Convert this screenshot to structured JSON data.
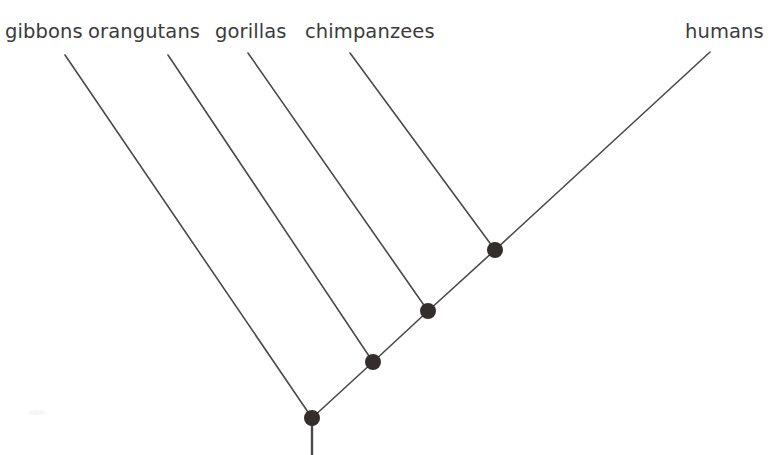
{
  "figure": {
    "title_partial": "",
    "background_color": "#ffffff",
    "branch_color": "#4a4a4a",
    "node_color": "#332d2b",
    "label_color": "#3b3b3b"
  },
  "chart_data": {
    "type": "diagram",
    "diagram_type": "cladogram",
    "title": "",
    "xlabel": "",
    "ylabel": "",
    "taxa": [
      {
        "name": "gibbons",
        "label_x": 5,
        "label_y": 40,
        "tip_x": 65,
        "tip_y": 55,
        "parent": "root"
      },
      {
        "name": "orangutans",
        "label_x": 88,
        "label_y": 40,
        "tip_x": 168,
        "tip_y": 55,
        "parent": "node2"
      },
      {
        "name": "gorillas",
        "label_x": 215,
        "label_y": 40,
        "tip_x": 248,
        "tip_y": 53,
        "parent": "node3"
      },
      {
        "name": "chimpanzees",
        "label_x": 305,
        "label_y": 40,
        "tip_x": 350,
        "tip_y": 53,
        "parent": "node4"
      },
      {
        "name": "humans",
        "label_x": 685,
        "label_y": 40,
        "tip_x": 710,
        "tip_y": 52,
        "parent": "node4"
      }
    ],
    "nodes": [
      {
        "id": "root",
        "x": 312,
        "y": 418,
        "radius": 8
      },
      {
        "id": "node2",
        "x": 373,
        "y": 362,
        "radius": 8
      },
      {
        "id": "node3",
        "x": 428,
        "y": 311,
        "radius": 8
      },
      {
        "id": "node4",
        "x": 495,
        "y": 250,
        "radius": 8
      }
    ],
    "branches": [
      {
        "from": "tip-gibbons",
        "x1": 65,
        "y1": 55,
        "x2": 312,
        "y2": 418
      },
      {
        "from": "tip-orangutans",
        "x1": 168,
        "y1": 55,
        "x2": 373,
        "y2": 362
      },
      {
        "from": "tip-gorillas",
        "x1": 248,
        "y1": 53,
        "x2": 428,
        "y2": 311
      },
      {
        "from": "tip-chimpanzees",
        "x1": 350,
        "y1": 53,
        "x2": 495,
        "y2": 250
      },
      {
        "from": "tip-humans",
        "x1": 710,
        "y1": 52,
        "x2": 495,
        "y2": 250
      },
      {
        "from": "node4-node3",
        "x1": 495,
        "y1": 250,
        "x2": 428,
        "y2": 311
      },
      {
        "from": "node3-node2",
        "x1": 428,
        "y1": 311,
        "x2": 373,
        "y2": 362
      },
      {
        "from": "node2-root",
        "x1": 373,
        "y1": 362,
        "x2": 312,
        "y2": 418
      }
    ],
    "root_stem": {
      "x1": 312,
      "y1": 418,
      "x2": 312,
      "y2": 455
    },
    "topology": "(gibbons,(orangutans,(gorillas,(chimpanzees,humans))))",
    "legend": [],
    "grid": false
  },
  "labels": {
    "gibbons": "gibbons",
    "orangutans": "orangutans",
    "gorillas": "gorillas",
    "chimpanzees": "chimpanzees",
    "humans": "humans"
  }
}
